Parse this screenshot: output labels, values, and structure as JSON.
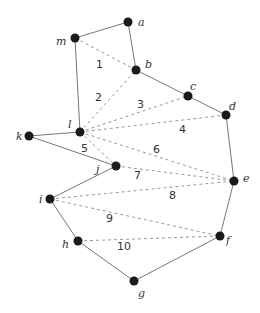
{
  "diagram": {
    "vertices": [
      {
        "id": "a",
        "label": "a",
        "x": 128,
        "y": 22,
        "lx": 138,
        "ly": 26
      },
      {
        "id": "m",
        "label": "m",
        "x": 75,
        "y": 38,
        "lx": 56,
        "ly": 45
      },
      {
        "id": "b",
        "label": "b",
        "x": 136,
        "y": 70,
        "lx": 145,
        "ly": 68
      },
      {
        "id": "c",
        "label": "c",
        "x": 188,
        "y": 96,
        "lx": 190,
        "ly": 90
      },
      {
        "id": "d",
        "label": "d",
        "x": 226,
        "y": 115,
        "lx": 229,
        "ly": 110
      },
      {
        "id": "l",
        "label": "l",
        "x": 80,
        "y": 132,
        "lx": 68,
        "ly": 128
      },
      {
        "id": "k",
        "label": "k",
        "x": 29,
        "y": 136,
        "lx": 16,
        "ly": 140
      },
      {
        "id": "j",
        "label": "j",
        "x": 116,
        "y": 166,
        "lx": 96,
        "ly": 173
      },
      {
        "id": "e",
        "label": "e",
        "x": 234,
        "y": 181,
        "lx": 243,
        "ly": 182
      },
      {
        "id": "i",
        "label": "i",
        "x": 50,
        "y": 199,
        "lx": 39,
        "ly": 203
      },
      {
        "id": "f",
        "label": "f",
        "x": 220,
        "y": 236,
        "lx": 226,
        "ly": 244
      },
      {
        "id": "h",
        "label": "h",
        "x": 78,
        "y": 241,
        "lx": 62,
        "ly": 248
      },
      {
        "id": "g",
        "label": "g",
        "x": 134,
        "y": 281,
        "lx": 138,
        "ly": 297
      }
    ],
    "edges": [
      [
        "m",
        "a"
      ],
      [
        "a",
        "b"
      ],
      [
        "b",
        "c"
      ],
      [
        "c",
        "d"
      ],
      [
        "d",
        "e"
      ],
      [
        "e",
        "f"
      ],
      [
        "f",
        "g"
      ],
      [
        "g",
        "h"
      ],
      [
        "h",
        "i"
      ],
      [
        "i",
        "j"
      ],
      [
        "j",
        "k"
      ],
      [
        "k",
        "l"
      ],
      [
        "l",
        "m"
      ]
    ],
    "diagonals": [
      {
        "from": "m",
        "to": "b",
        "label": "1",
        "lx": 96,
        "ly": 68
      },
      {
        "from": "l",
        "to": "b",
        "label": "2",
        "lx": 95,
        "ly": 101
      },
      {
        "from": "l",
        "to": "c",
        "label": "3",
        "lx": 137,
        "ly": 108
      },
      {
        "from": "l",
        "to": "d",
        "label": "4",
        "lx": 179,
        "ly": 133
      },
      {
        "from": "l",
        "to": "j",
        "label": "5",
        "lx": 81,
        "ly": 152
      },
      {
        "from": "l",
        "to": "e",
        "label": "6",
        "lx": 153,
        "ly": 153
      },
      {
        "from": "j",
        "to": "e",
        "label": "7",
        "lx": 134,
        "ly": 179
      },
      {
        "from": "i",
        "to": "e",
        "label": "8",
        "lx": 169,
        "ly": 199
      },
      {
        "from": "i",
        "to": "f",
        "label": "9",
        "lx": 106,
        "ly": 222
      },
      {
        "from": "h",
        "to": "f",
        "label": "10",
        "lx": 117,
        "ly": 250
      }
    ]
  }
}
